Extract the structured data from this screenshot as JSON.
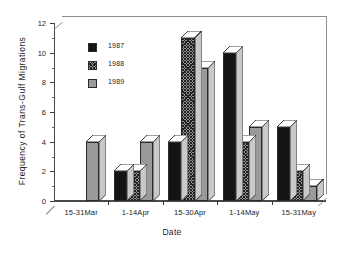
{
  "chart_data": {
    "type": "bar",
    "title": "",
    "xlabel": "Date",
    "ylabel": "Frequency of Trans-Gulf Migrations",
    "categories": [
      "15-31Mar",
      "1-14Apr",
      "15-30Apr",
      "1-14May",
      "15-31May"
    ],
    "series": [
      {
        "name": "1987",
        "values": [
          0,
          2,
          4,
          10,
          5
        ],
        "fill": "solid-black",
        "color": "#141414"
      },
      {
        "name": "1988",
        "values": [
          0,
          2,
          11,
          4,
          2
        ],
        "fill": "crosshatch",
        "color": "#8f8f8f"
      },
      {
        "name": "1989",
        "values": [
          4,
          4,
          9,
          5,
          1
        ],
        "fill": "light-gray",
        "color": "#9a9a9a"
      }
    ],
    "ylim": [
      0,
      12
    ],
    "y_major_ticks": [
      0,
      2,
      4,
      6,
      8,
      10,
      12
    ],
    "y_minor_ticks": [
      1,
      3,
      5,
      7,
      9,
      11
    ],
    "ytick_labels": [
      "0",
      "2",
      "4",
      "6",
      "8",
      "10",
      "12"
    ],
    "grid": false,
    "legend_position": "upper-left-inside",
    "style": "3d-bars"
  },
  "legend": {
    "entries": [
      {
        "label": "1987"
      },
      {
        "label": "1988"
      },
      {
        "label": "1989"
      }
    ]
  }
}
